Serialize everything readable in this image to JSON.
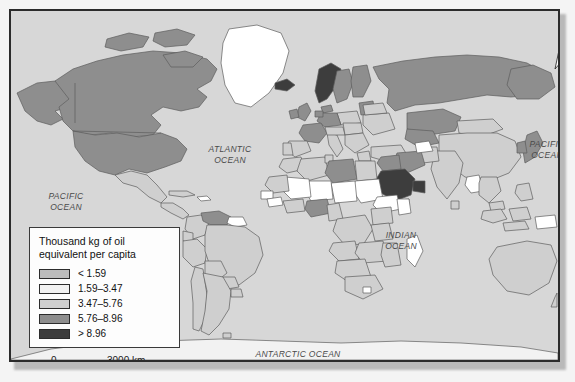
{
  "map": {
    "title_hidden": "",
    "legend": {
      "title": "Thousand kg of oil\nequivalent per capita",
      "entries": [
        {
          "label": "< 1.59",
          "color": "#bdbdbd"
        },
        {
          "label": "1.59–3.47",
          "color": "#f2f2f2"
        },
        {
          "label": "3.47–5.76",
          "color": "#cfcfcf"
        },
        {
          "label": "5.76–8.96",
          "color": "#8e8e8e"
        },
        {
          "label": "> 8.96",
          "color": "#3d3d3d"
        }
      ]
    },
    "ocean_labels": {
      "pacific_west": "PACIFIC\nOCEAN",
      "pacific_east": "PACIFIC\nOCEAN",
      "atlantic": "ATLANTIC\nOCEAN",
      "indian": "INDIAN\nOCEAN",
      "antarctic": "ANTARCTIC OCEAN"
    },
    "north_arrow": {
      "label": "N"
    },
    "scale_bar": {
      "min_label": "0",
      "max_label": "3000 km"
    },
    "colors": {
      "ocean": "#d7d7d7",
      "no_data": "#ffffff",
      "country_stroke": "#5d5d5d",
      "frame": "#2b2b2b",
      "page_background": "#f4f4f4"
    }
  }
}
